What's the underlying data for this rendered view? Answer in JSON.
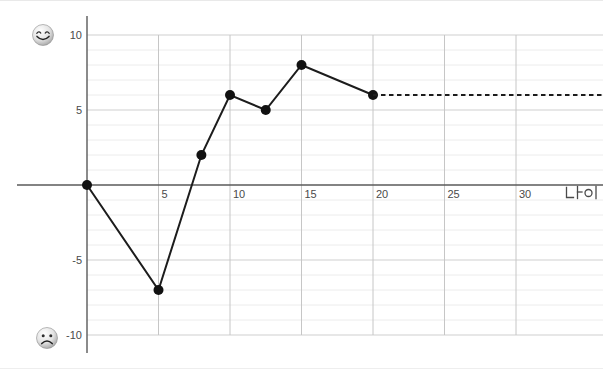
{
  "page": {
    "background": "#ffffff"
  },
  "icons": {
    "happy": "smiling-face-icon",
    "sad": "frowning-face-icon"
  },
  "chart_data": {
    "type": "line",
    "title": "",
    "xlabel": "나이",
    "ylabel": "",
    "x_ticks": [
      5,
      10,
      15,
      20,
      25,
      30
    ],
    "y_ticks": [
      10,
      5,
      -5,
      -10
    ],
    "xlim": [
      0,
      36
    ],
    "ylim": [
      -10,
      10
    ],
    "grid": "on",
    "legend": "none",
    "series": [
      {
        "name": "happiness-by-age",
        "style": "solid",
        "markers": true,
        "points": [
          [
            0,
            0
          ],
          [
            5,
            -7
          ],
          [
            8,
            2
          ],
          [
            10,
            6
          ],
          [
            12.5,
            5
          ],
          [
            15,
            8
          ],
          [
            20,
            6
          ]
        ]
      },
      {
        "name": "projection-after-20",
        "style": "dashed",
        "markers": false,
        "points": [
          [
            20,
            6
          ],
          [
            36,
            6
          ]
        ]
      }
    ],
    "colors": {
      "line": "#1c1c1c",
      "point": "#111111",
      "grid_minor": "#ececec",
      "grid_major": "#cfcfcf",
      "grid_vertical": "#c6c6c6",
      "axis": "#5a5a5a",
      "tick_label": "#4a4a4a"
    }
  }
}
